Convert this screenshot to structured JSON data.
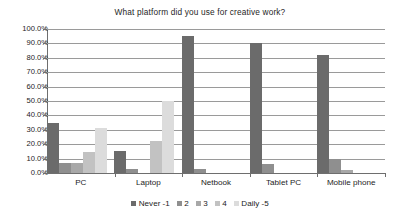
{
  "chart_data": {
    "type": "bar",
    "title": "What platform did you use for creative work?",
    "xlabel": "",
    "ylabel": "",
    "ylim": [
      0,
      100
    ],
    "grid": true,
    "legend_position": "bottom",
    "y_tick_labels": [
      "100.0%",
      "90.0%",
      "80.0%",
      "70.0%",
      "60.0%",
      "50.0%",
      "40.0%",
      "30.0%",
      "20.0%",
      "10.0%",
      "0.0%"
    ],
    "categories": [
      "PC",
      "Laptop",
      "Netbook",
      "Tablet PC",
      "Mobile phone"
    ],
    "series": [
      {
        "name": "Never -1",
        "color": "#6b6b6b",
        "values": [
          35.0,
          15.0,
          95.0,
          90.5,
          82.0
        ]
      },
      {
        "name": "2",
        "color": "#8f8f8f",
        "values": [
          7.0,
          3.0,
          3.0,
          6.0,
          10.0
        ]
      },
      {
        "name": "3",
        "color": "#a8a8a8",
        "values": [
          7.0,
          0.0,
          0.0,
          0.0,
          2.0
        ]
      },
      {
        "name": "4",
        "color": "#c2c2c2",
        "values": [
          14.5,
          22.0,
          0.0,
          0.0,
          0.0
        ]
      },
      {
        "name": "Daily -5",
        "color": "#dcdcdc",
        "values": [
          31.0,
          50.0,
          0.0,
          0.0,
          0.0
        ]
      }
    ]
  }
}
